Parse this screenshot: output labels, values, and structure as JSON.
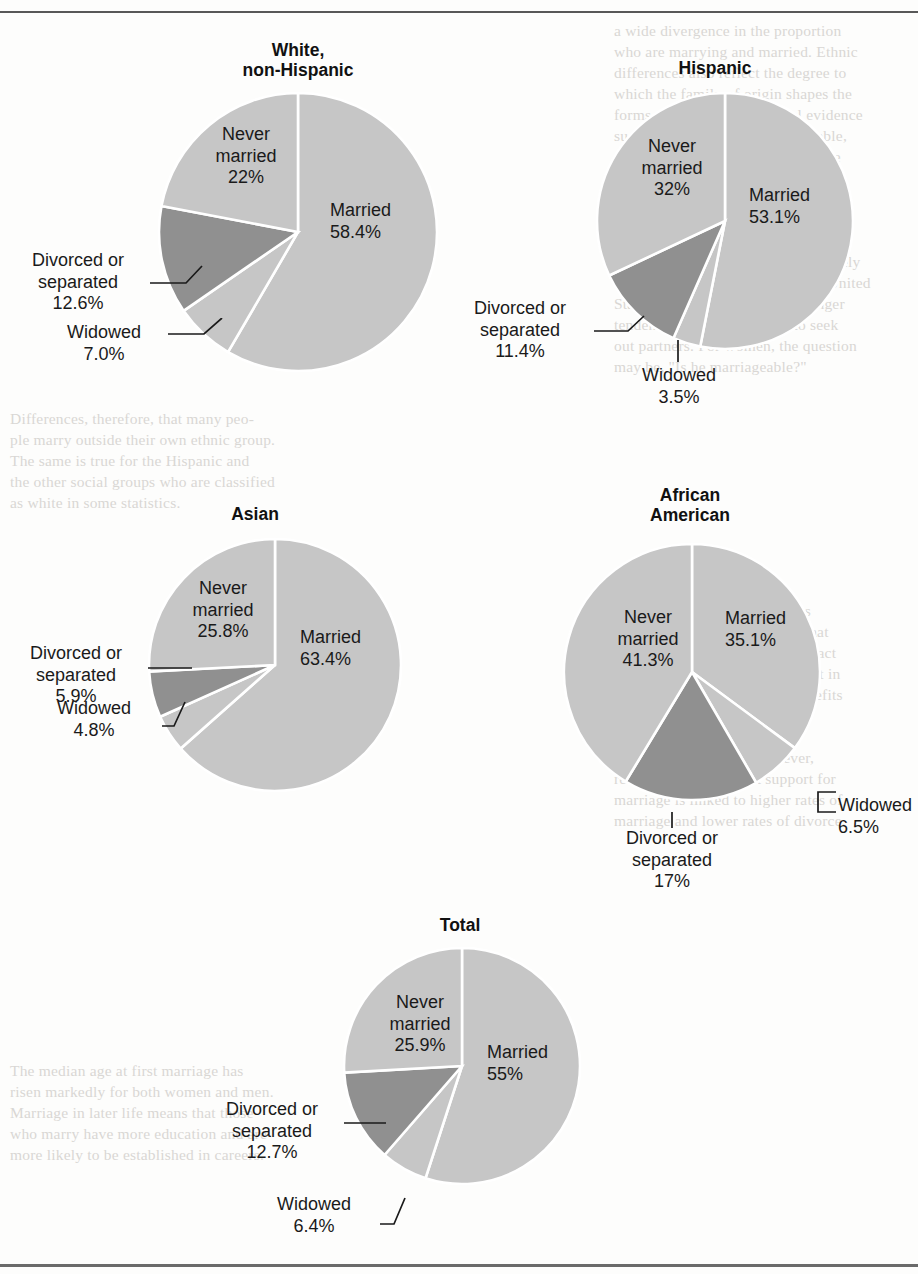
{
  "figure": {
    "kind": "pie-chart-panel",
    "background_note": "scanned book page with faint show-through text",
    "rule_color": "#585858"
  },
  "palette": {
    "slice_light": "#c6c6c6",
    "slice_dark": "#909090",
    "gap": "#ffffff",
    "text": "#1a1a1a",
    "title": "#111111"
  },
  "categories": [
    "Married",
    "Widowed",
    "Divorced or separated",
    "Never married"
  ],
  "charts": [
    {
      "id": "white-non-hispanic",
      "title": "White,\nnon-Hispanic",
      "slices": [
        {
          "label": "Married",
          "value": 58.4,
          "value_text": "58.4%",
          "shade": "light",
          "placement": "inside"
        },
        {
          "label": "Widowed",
          "value": 7.0,
          "value_text": "7.0%",
          "shade": "light",
          "placement": "leader"
        },
        {
          "label": "Divorced or\nseparated",
          "value": 12.6,
          "value_text": "12.6%",
          "shade": "dark",
          "placement": "leader"
        },
        {
          "label": "Never\nmarried",
          "value": 22,
          "value_text": "22%",
          "shade": "light",
          "placement": "inside"
        }
      ]
    },
    {
      "id": "hispanic",
      "title": "Hispanic",
      "slices": [
        {
          "label": "Married",
          "value": 53.1,
          "value_text": "53.1%",
          "shade": "light",
          "placement": "inside"
        },
        {
          "label": "Widowed",
          "value": 3.5,
          "value_text": "3.5%",
          "shade": "light",
          "placement": "leader"
        },
        {
          "label": "Divorced or\nseparated",
          "value": 11.4,
          "value_text": "11.4%",
          "shade": "dark",
          "placement": "leader"
        },
        {
          "label": "Never\nmarried",
          "value": 32,
          "value_text": "32%",
          "shade": "light",
          "placement": "inside"
        }
      ]
    },
    {
      "id": "asian",
      "title": "Asian",
      "slices": [
        {
          "label": "Married",
          "value": 63.4,
          "value_text": "63.4%",
          "shade": "light",
          "placement": "inside"
        },
        {
          "label": "Widowed",
          "value": 4.8,
          "value_text": "4.8%",
          "shade": "light",
          "placement": "leader"
        },
        {
          "label": "Divorced or\nseparated",
          "value": 5.9,
          "value_text": "5.9%",
          "shade": "dark",
          "placement": "leader"
        },
        {
          "label": "Never\nmarried",
          "value": 25.8,
          "value_text": "25.8%",
          "shade": "light",
          "placement": "inside"
        }
      ]
    },
    {
      "id": "african-american",
      "title": "African\nAmerican",
      "slices": [
        {
          "label": "Married",
          "value": 35.1,
          "value_text": "35.1%",
          "shade": "light",
          "placement": "inside"
        },
        {
          "label": "Widowed",
          "value": 6.5,
          "value_text": "6.5%",
          "shade": "light",
          "placement": "leader"
        },
        {
          "label": "Divorced or\nseparated",
          "value": 17,
          "value_text": "17%",
          "shade": "dark",
          "placement": "leader"
        },
        {
          "label": "Never\nmarried",
          "value": 41.3,
          "value_text": "41.3%",
          "shade": "light",
          "placement": "inside"
        }
      ]
    },
    {
      "id": "total",
      "title": "Total",
      "slices": [
        {
          "label": "Married",
          "value": 55,
          "value_text": "55%",
          "shade": "light",
          "placement": "inside"
        },
        {
          "label": "Widowed",
          "value": 6.4,
          "value_text": "6.4%",
          "shade": "light",
          "placement": "leader"
        },
        {
          "label": "Divorced or\nseparated",
          "value": 12.7,
          "value_text": "12.7%",
          "shade": "dark",
          "placement": "leader"
        },
        {
          "label": "Never\nmarried",
          "value": 25.9,
          "value_text": "25.9%",
          "shade": "light",
          "placement": "inside"
        }
      ]
    }
  ],
  "chart_data": {
    "type": "pie",
    "categories": [
      "Married",
      "Widowed",
      "Divorced or separated",
      "Never married"
    ],
    "legend_position": "none (direct labels)",
    "grid": false,
    "series": [
      {
        "name": "White, non-Hispanic",
        "values": [
          58.4,
          7.0,
          12.6,
          22
        ]
      },
      {
        "name": "Hispanic",
        "values": [
          53.1,
          3.5,
          11.4,
          32
        ]
      },
      {
        "name": "Asian",
        "values": [
          63.4,
          4.8,
          5.9,
          25.8
        ]
      },
      {
        "name": "African American",
        "values": [
          35.1,
          6.5,
          17,
          41.3
        ]
      },
      {
        "name": "Total",
        "values": [
          55,
          6.4,
          12.7,
          25.9
        ]
      }
    ],
    "units": "percent",
    "colors": {
      "light": "#c6c6c6",
      "dark": "#909090"
    }
  },
  "bleed_text": {
    "top_right": "a wide divergence in the proportion\nwho are marrying and married. Ethnic\ndifferences also reflect the degree to\nwhich the family of origin shapes the\nforms of marriage. Anecdotal evidence\nsuggests that this can be formidable,\nand may reflect marriages for some\ngroups that are arranged by families.\nSociological research has found that\nmarital patterns and family values\nare associated with the values from\nthe group to which one is most closely\ntied. Several social factors in the United\nStates today contribute to a stronger\ntendency for certain groups to seek\nout partners. For women, the question\nmay be, \"Is he marriageable?\"",
    "mid_right": "Marriage and divorce statistics\ncan mislead us into believing that\nmarriage is declining, when in fact\nmost people marry at some point in\ntheir lives. Research on the benefits\nof marriage suggests that the\nbenefits of marriage are both\neconomic and social. However,\nresearch also finds that support for\nmarriage is linked to higher rates of\nmarriage and lower rates of divorce.",
    "left_mid": "Differences, therefore, that many peo-\nple marry outside their own ethnic group.\nThe same is true for the Hispanic and\nthe other social groups who are classified\nas white in some statistics.",
    "left_lower": "The median age at first marriage has\nrisen markedly for both women and men.\nMarriage in later life means that those\nwho marry have more education and are\nmore likely to be established in careers."
  }
}
